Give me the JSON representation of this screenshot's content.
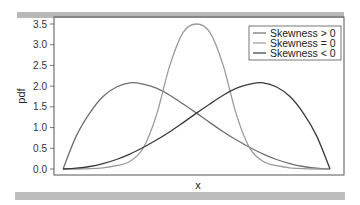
{
  "chart_data": {
    "type": "line",
    "title": "",
    "xlabel": "x",
    "ylabel": "pdf",
    "ylim": [
      0.0,
      3.5
    ],
    "yticks": [
      "0.0",
      "0.5",
      "1.0",
      "1.5",
      "2.0",
      "2.5",
      "3.0",
      "3.5"
    ],
    "xticks": [],
    "grid": false,
    "legend_position": "upper right",
    "x": [
      0.0,
      0.05,
      0.1,
      0.15,
      0.2,
      0.25,
      0.3,
      0.35,
      0.4,
      0.45,
      0.5,
      0.55,
      0.6,
      0.65,
      0.7,
      0.75,
      0.8,
      0.85,
      0.9,
      0.95,
      1.0
    ],
    "series": [
      {
        "name": "Skewness > 0",
        "color": "#6e6e6e",
        "values": [
          0.0,
          0.8,
          1.35,
          1.75,
          1.98,
          2.08,
          2.05,
          1.95,
          1.78,
          1.57,
          1.35,
          1.12,
          0.9,
          0.7,
          0.52,
          0.36,
          0.23,
          0.13,
          0.06,
          0.02,
          0.0
        ]
      },
      {
        "name": "Skewness = 0",
        "color": "#9a9a9a",
        "values": [
          0.0,
          0.0,
          0.01,
          0.03,
          0.08,
          0.18,
          0.5,
          1.3,
          2.5,
          3.3,
          3.5,
          3.3,
          2.5,
          1.3,
          0.5,
          0.18,
          0.08,
          0.03,
          0.01,
          0.0,
          0.0
        ]
      },
      {
        "name": "Skewness < 0",
        "color": "#3a3a3a",
        "values": [
          0.0,
          0.02,
          0.06,
          0.13,
          0.23,
          0.36,
          0.52,
          0.7,
          0.9,
          1.12,
          1.35,
          1.57,
          1.78,
          1.95,
          2.05,
          2.08,
          1.98,
          1.75,
          1.35,
          0.8,
          0.0
        ]
      }
    ]
  },
  "legend": {
    "items": [
      {
        "label": "Skewness > 0",
        "color": "#6e6e6e"
      },
      {
        "label": "Skewness = 0",
        "color": "#9a9a9a"
      },
      {
        "label": "Skewness < 0",
        "color": "#3a3a3a"
      }
    ]
  },
  "axes": {
    "xlabel": "x",
    "ylabel": "pdf"
  }
}
